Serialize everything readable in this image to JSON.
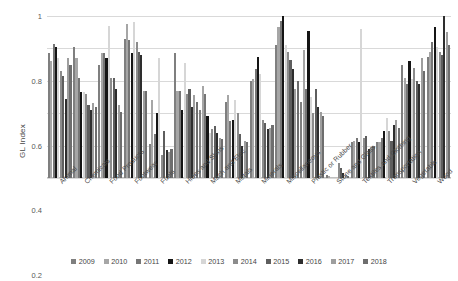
{
  "chart_data": {
    "type": "bar",
    "title": "",
    "xlabel": "",
    "ylabel": "GL Index",
    "ylim": [
      0,
      1
    ],
    "yticks": [
      "0",
      "0.2",
      "0.4",
      "0.6",
      "0.8",
      "1"
    ],
    "grid": true,
    "legend_position": "bottom",
    "categories": [
      "Animal",
      "Chemicals",
      "Food Products",
      "Footwear",
      "Fuels",
      "Hides and Skins",
      "Mach and Elec",
      "Metals",
      "Minerals",
      "Miscellaneous",
      "Plastic or Rubber",
      "Stone and Glass",
      "Textiles and Clothing",
      "Transportation",
      "Vegetable",
      "Wood"
    ],
    "series": [
      {
        "name": "2009",
        "color": "#7f7f7f",
        "values": [
          0.77,
          0.81,
          0.7,
          0.86,
          0.21,
          0.77,
          0.42,
          0.47,
          0.6,
          0.82,
          0.47,
          0.02,
          0.22,
          0.22,
          0.7,
          0.75
        ]
      },
      {
        "name": "2010",
        "color": "#a6a6a6",
        "values": [
          0.72,
          0.74,
          0.77,
          0.95,
          0.48,
          0.54,
          0.57,
          0.51,
          0.61,
          0.93,
          0.79,
          0.01,
          0.23,
          0.22,
          0.62,
          0.78
        ]
      },
      {
        "name": "2011",
        "color": "#767676",
        "values": [
          0.83,
          0.62,
          0.77,
          0.85,
          0.27,
          0.54,
          0.52,
          0.35,
          0.67,
          0.97,
          0.55,
          0.0,
          0.25,
          0.25,
          0.58,
          0.84
        ]
      },
      {
        "name": "2012",
        "color": "#151515",
        "values": [
          0.81,
          0.53,
          0.74,
          0.77,
          0.4,
          0.42,
          0.38,
          0.36,
          0.75,
          1.0,
          0.91,
          0.0,
          0.22,
          0.29,
          0.72,
          0.93
        ]
      },
      {
        "name": "2013",
        "color": "#d6d6d6",
        "values": [
          0.74,
          0.53,
          0.94,
          0.96,
          0.74,
          0.71,
          0.28,
          0.48,
          0.64,
          0.82,
          0.5,
          0.0,
          0.92,
          0.37,
          0.61,
          0.81
        ]
      },
      {
        "name": "2014",
        "color": "#8c8c8c",
        "values": [
          0.66,
          0.52,
          0.62,
          0.84,
          0.14,
          0.52,
          0.3,
          0.4,
          0.36,
          0.78,
          0.4,
          0.09,
          0.25,
          0.29,
          0.68,
          0.78
        ]
      },
      {
        "name": "2015",
        "color": "#5e5e5e",
        "values": [
          0.63,
          0.45,
          0.62,
          0.78,
          0.29,
          0.55,
          0.32,
          0.27,
          0.34,
          0.73,
          0.55,
          0.06,
          0.26,
          0.23,
          0.6,
          0.76
        ]
      },
      {
        "name": "2016",
        "color": "#2e2e2e",
        "values": [
          0.49,
          0.42,
          0.55,
          0.76,
          0.17,
          0.44,
          0.28,
          0.2,
          0.3,
          0.67,
          0.44,
          0.03,
          0.18,
          0.33,
          0.58,
          1.0
        ]
      },
      {
        "name": "2017",
        "color": "#9e9e9e",
        "values": [
          0.74,
          0.46,
          0.45,
          0.54,
          0.16,
          0.51,
          0.25,
          0.23,
          0.31,
          0.55,
          0.41,
          0.02,
          0.19,
          0.36,
          0.74,
          0.9
        ]
      },
      {
        "name": "2018",
        "color": "#6e6e6e",
        "values": [
          0.7,
          0.44,
          0.41,
          0.54,
          0.18,
          0.47,
          0.24,
          0.22,
          0.33,
          0.6,
          0.38,
          0.01,
          0.2,
          0.31,
          0.66,
          0.82
        ]
      }
    ]
  }
}
